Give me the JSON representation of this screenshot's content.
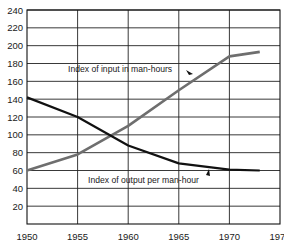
{
  "chart_data": {
    "type": "line",
    "title": "",
    "xlabel": "",
    "ylabel": "",
    "x": [
      1950,
      1955,
      1960,
      1965,
      1970,
      1973
    ],
    "x_ticks": [
      "1950",
      "1955",
      "1960",
      "1965",
      "1970",
      "1975"
    ],
    "y_ticks": [
      "20",
      "40",
      "60",
      "80",
      "100",
      "120",
      "140",
      "160",
      "180",
      "200",
      "220",
      "240"
    ],
    "xlim": [
      1950,
      1975
    ],
    "ylim": [
      0,
      240
    ],
    "grid": true,
    "legend": "inline annotations",
    "series": [
      {
        "name": "Index of input in man-hours",
        "color": "#6e6e6e",
        "values": [
          60,
          78,
          110,
          150,
          188,
          193
        ]
      },
      {
        "name": "Index of output per man-hour",
        "color": "#111111",
        "values": [
          142,
          120,
          88,
          68,
          61,
          60
        ]
      }
    ],
    "annotations": [
      {
        "text": "Index of input in man-hours",
        "target_series": 0
      },
      {
        "text": "Index of output per man-hour",
        "target_series": 1
      }
    ]
  }
}
